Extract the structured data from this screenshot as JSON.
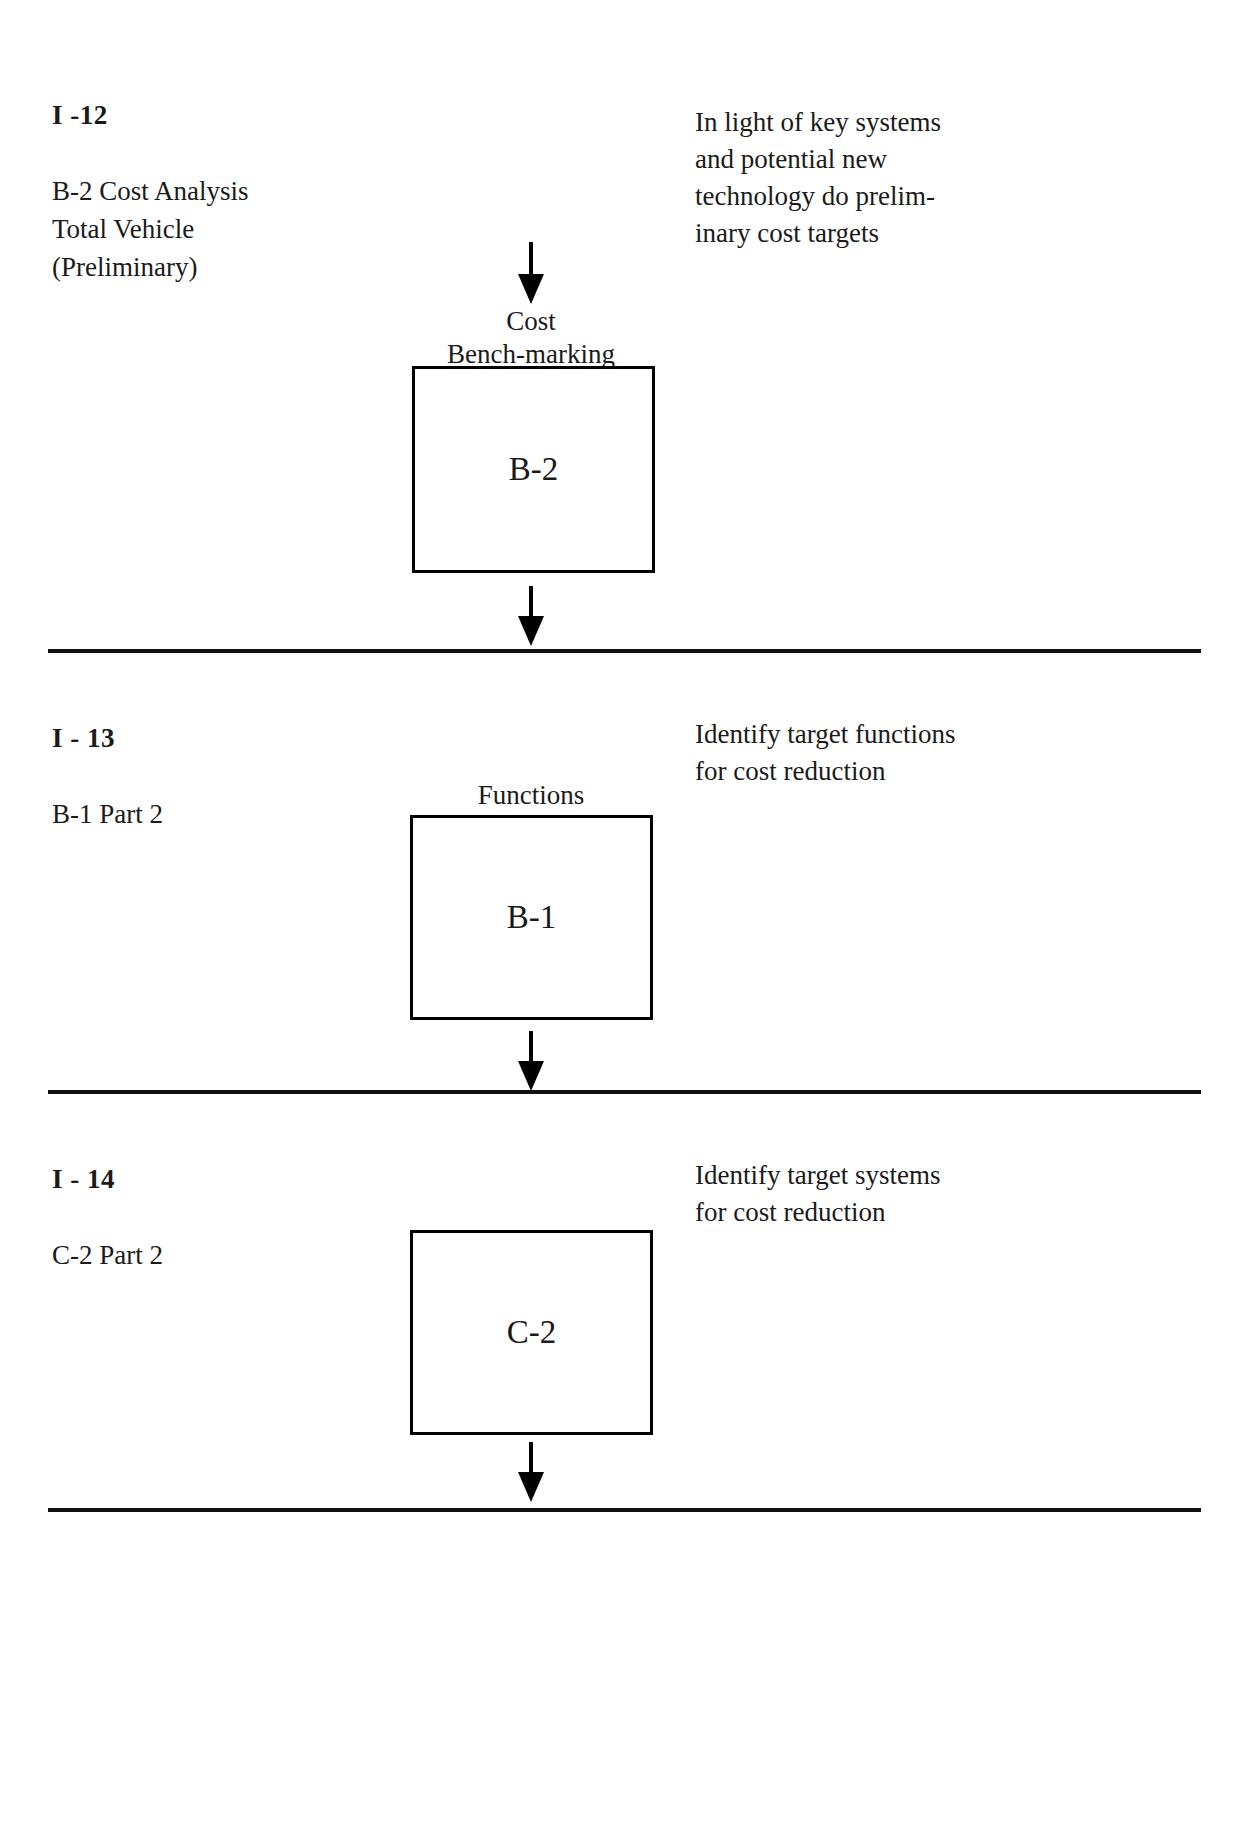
{
  "document": {
    "type": "process-flow-diagram"
  },
  "sections": [
    {
      "code": "I -12",
      "subtitle": "B-2 Cost Analysis\nTotal  Vehicle\n(Preliminary)",
      "description": "In light of key systems\nand potential new\ntechnology do prelim-\ninary cost targets",
      "box_caption": "Cost\nBench-marking",
      "box_label": "B-2"
    },
    {
      "code": "I - 13",
      "subtitle": "B-1 Part 2",
      "description": "Identify target functions\nfor cost reduction",
      "box_caption": "Functions",
      "box_label": "B-1"
    },
    {
      "code": "I - 14",
      "subtitle": "C-2 Part 2",
      "description": "Identify target systems\nfor cost reduction",
      "box_caption": "",
      "box_label": "C-2"
    }
  ]
}
